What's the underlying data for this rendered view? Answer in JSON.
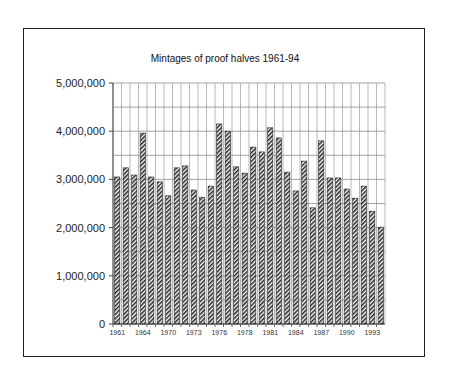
{
  "chart_data": {
    "type": "bar",
    "title": "Mintages of proof halves 1961-94",
    "xlabel": "",
    "ylabel": "",
    "ylim": [
      0,
      5000000
    ],
    "yticks": [
      0,
      1000000,
      2000000,
      3000000,
      4000000,
      5000000
    ],
    "ytick_labels": [
      "0",
      "1,000,000",
      "2,000,000",
      "3,000,000",
      "4,000,000",
      "5,000,000"
    ],
    "minor_grid_step": 500000,
    "grid": true,
    "legend": "none",
    "xtick_labels_shown": [
      "1961",
      "1964",
      "1970",
      "1973",
      "1976",
      "1978",
      "1981",
      "1984",
      "1987",
      "1990",
      "1993"
    ],
    "categories": [
      "1961",
      "1962",
      "1963",
      "1964",
      "1968",
      "1969",
      "1970",
      "1971",
      "1972",
      "1973",
      "1974",
      "1975",
      "1976",
      "1976",
      "1977",
      "1978",
      "1979",
      "1980",
      "1981",
      "1982",
      "1983",
      "1984",
      "1985",
      "1986",
      "1987",
      "1988",
      "1989",
      "1990",
      "1991",
      "1992",
      "1993",
      "1994"
    ],
    "values": [
      3050000,
      3240000,
      3090000,
      3960000,
      3050000,
      2950000,
      2660000,
      3240000,
      3280000,
      2780000,
      2630000,
      2860000,
      4150000,
      4000000,
      3260000,
      3130000,
      3670000,
      3570000,
      4070000,
      3860000,
      3150000,
      2760000,
      3380000,
      2410000,
      3800000,
      3030000,
      3030000,
      2800000,
      2610000,
      2860000,
      2340000,
      2010000
    ],
    "series": [
      {
        "name": "Proof halves mintage",
        "pattern": "diagonal-hatch",
        "color": "#333333"
      }
    ]
  }
}
